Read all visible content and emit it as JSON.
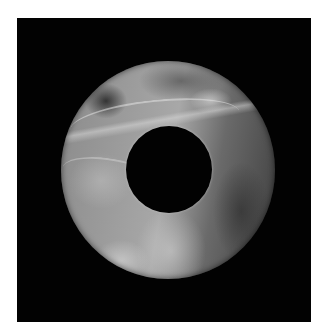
{
  "image": {
    "subject": "jade bi disc",
    "background_color": "#020202",
    "page_color": "#ffffff",
    "disc": {
      "center": [
        168,
        170
      ],
      "outer_radius": 107,
      "inner_radius": 43
    },
    "palette": [
      "#f0f0f0",
      "#a8a8a8",
      "#6a6a6a",
      "#2a2a2a"
    ]
  }
}
